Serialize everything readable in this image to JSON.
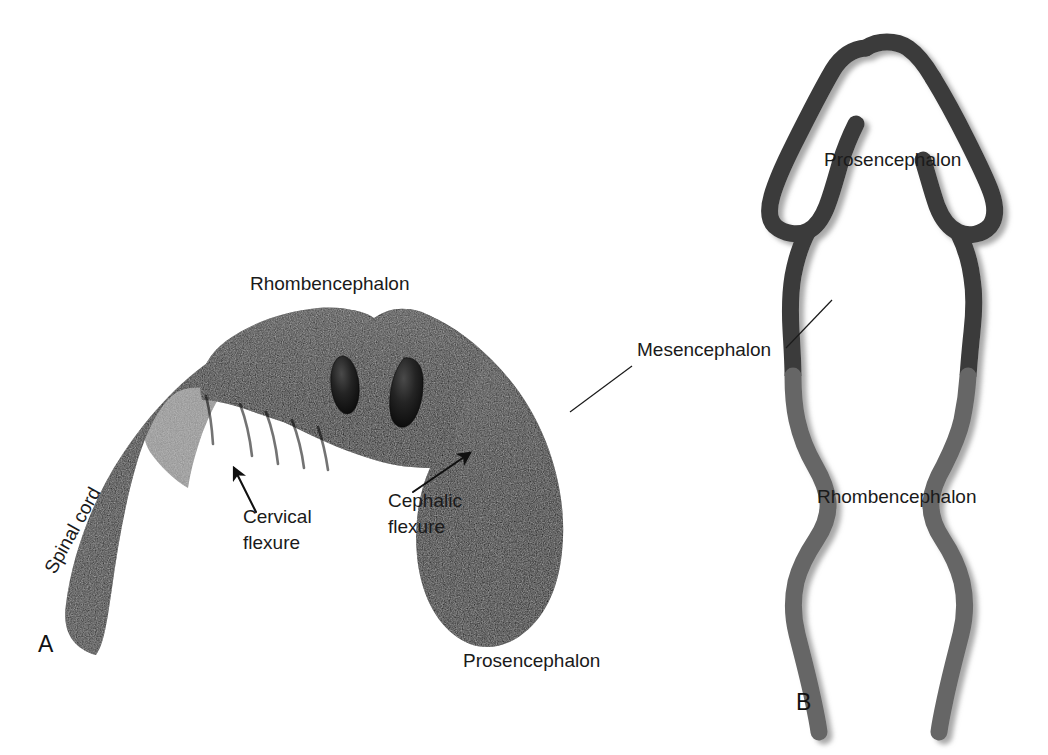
{
  "figure": {
    "background_color": "#ffffff",
    "width": 1048,
    "height": 755
  },
  "panels": [
    {
      "id": "A",
      "letter": "A",
      "name": "lateral-view-embryonic-brain",
      "description": "Shaded lateral view of embryonic brain showing flexures",
      "letter_position": {
        "x": 38,
        "y": 652
      },
      "fill_color": "#111111",
      "midbrain_fill_color": "#2e2e2e"
    },
    {
      "id": "B",
      "letter": "B",
      "name": "dorsal-view-neural-tube-outline",
      "description": "Dorsal outline view of neural tube with vesicle regions",
      "letter_position": {
        "x": 796,
        "y": 710
      },
      "rostral_color": "#3b3b3b",
      "caudal_color": "#666666",
      "shadow_color": "#bdbdbd"
    }
  ],
  "labels": [
    {
      "name": "label-rhombencephalon-a",
      "text": "Rhombencephalon",
      "panel": "A",
      "x": 250,
      "y": 290,
      "rotation": 0,
      "anchor": "start"
    },
    {
      "name": "label-spinal-cord",
      "text": "Spinal cord",
      "panel": "A",
      "x": 55,
      "y": 575,
      "rotation": -61,
      "anchor": "start"
    },
    {
      "name": "label-cervical-flexure",
      "text": "Cervical\nflexure",
      "line1": "Cervical",
      "line2": "flexure",
      "panel": "A",
      "x": 243,
      "y": 523,
      "rotation": 0,
      "anchor": "start"
    },
    {
      "name": "label-cephalic-flexure",
      "text": "Cephalic\nflexure",
      "line1": "Cephalic",
      "line2": "flexure",
      "panel": "A",
      "x": 388,
      "y": 507,
      "rotation": 0,
      "anchor": "start"
    },
    {
      "name": "label-prosencephalon-a",
      "text": "Prosencephalon",
      "panel": "A",
      "x": 463,
      "y": 667,
      "rotation": 0,
      "anchor": "start"
    },
    {
      "name": "label-mesencephalon",
      "text": "Mesencephalon",
      "panel": "AB",
      "x": 637,
      "y": 356,
      "rotation": 0,
      "anchor": "start"
    },
    {
      "name": "label-prosencephalon-b",
      "text": "Prosencephalon",
      "panel": "B",
      "x": 824,
      "y": 166,
      "rotation": 0,
      "anchor": "start"
    },
    {
      "name": "label-rhombencephalon-b",
      "text": "Rhombencephalon",
      "panel": "B",
      "x": 817,
      "y": 503,
      "rotation": 0,
      "anchor": "start"
    }
  ],
  "leaders": [
    {
      "name": "leader-mesencephalon-to-panel-a",
      "from": {
        "x": 632,
        "y": 366
      },
      "to": {
        "x": 570,
        "y": 412
      }
    },
    {
      "name": "leader-mesencephalon-to-panel-b",
      "from": {
        "x": 786,
        "y": 348
      },
      "to": {
        "x": 830,
        "y": 302
      }
    }
  ],
  "arrows": [
    {
      "name": "arrow-cervical-flexure",
      "tail": {
        "x": 256,
        "y": 512
      },
      "head": {
        "x": 232,
        "y": 466
      }
    },
    {
      "name": "arrow-cephalic-flexure",
      "tail": {
        "x": 415,
        "y": 490
      },
      "head": {
        "x": 471,
        "y": 452
      }
    }
  ],
  "colors": {
    "text": "#1a1a1a",
    "panel_a_dark": "#111111",
    "panel_a_mid": "#2e2e2e",
    "panel_b_rostral": "#3b3b3b",
    "panel_b_caudal": "#666666",
    "shadow": "#c4c4c4",
    "background": "#ffffff"
  }
}
